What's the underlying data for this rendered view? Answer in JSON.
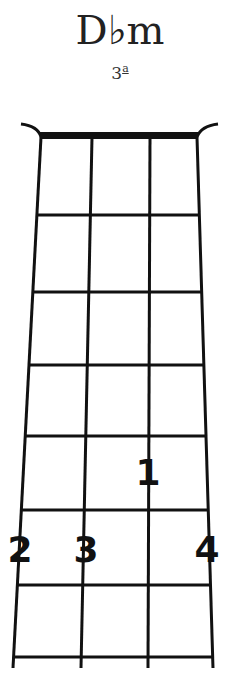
{
  "chord": {
    "name": "D♭m",
    "position": "3",
    "position_suffix": "a"
  },
  "diagram": {
    "strings": 4,
    "frets_shown": 7,
    "nut": true,
    "fingers": [
      {
        "label": "1",
        "string": 3,
        "fret": 5
      },
      {
        "label": "2",
        "string": 1,
        "fret": 6
      },
      {
        "label": "3",
        "string": 2,
        "fret": 6
      },
      {
        "label": "4",
        "string": 4,
        "fret": 6
      }
    ]
  }
}
